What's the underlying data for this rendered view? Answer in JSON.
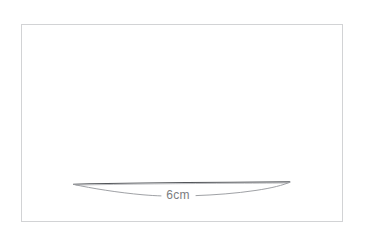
{
  "canvas": {
    "name": "geometry-sketch-canvas",
    "background_color": "#ffffff",
    "frame": {
      "label": "drawing frame",
      "border_color": "#d2d3d5",
      "x": 21,
      "y": 24,
      "width": 322,
      "height": 198
    }
  },
  "drawing": {
    "title": "flat lens shape with measurement",
    "shape_name": "lens",
    "top_edge_color": "#53565a",
    "bottom_arc_color": "#9a9ca0",
    "left_tip": {
      "x": 73,
      "y": 184
    },
    "right_tip": {
      "x": 290,
      "y": 182
    },
    "arc_lowest_y": 196
  },
  "labels": {
    "measurement": {
      "text": "6cm",
      "value": 6,
      "unit": "cm",
      "color": "#7b7d80",
      "x": 178,
      "y": 196
    }
  }
}
